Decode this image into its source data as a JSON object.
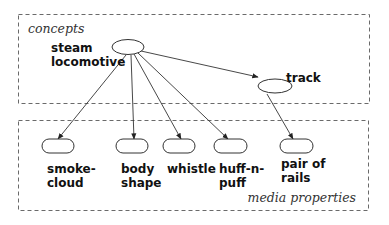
{
  "diagram": {
    "regions": {
      "concepts": {
        "label": "concepts"
      },
      "media": {
        "label": "media properties"
      }
    },
    "concept_nodes": [
      {
        "id": "steam-locomotive",
        "label_lines": [
          "steam",
          "locomotive"
        ]
      },
      {
        "id": "track",
        "label_lines": [
          "track"
        ]
      }
    ],
    "media_nodes": [
      {
        "id": "smoke-cloud",
        "label_lines": [
          "smoke-",
          "cloud"
        ]
      },
      {
        "id": "body-shape",
        "label_lines": [
          "body",
          "shape"
        ]
      },
      {
        "id": "whistle",
        "label_lines": [
          "whistle"
        ]
      },
      {
        "id": "huff-n-puff",
        "label_lines": [
          "huff-n-",
          "puff"
        ]
      },
      {
        "id": "pair-of-rails",
        "label_lines": [
          "pair of",
          "rails"
        ]
      }
    ],
    "edges": [
      {
        "from": "steam-locomotive",
        "to": "track"
      },
      {
        "from": "steam-locomotive",
        "to": "smoke-cloud"
      },
      {
        "from": "steam-locomotive",
        "to": "body-shape"
      },
      {
        "from": "steam-locomotive",
        "to": "whistle"
      },
      {
        "from": "steam-locomotive",
        "to": "huff-n-puff"
      },
      {
        "from": "track",
        "to": "pair-of-rails"
      }
    ]
  }
}
